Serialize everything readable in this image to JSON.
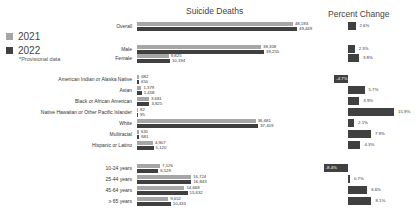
{
  "legend": {
    "items": [
      {
        "label": "2021",
        "color": "#a6a6a6"
      },
      {
        "label": "2022",
        "color": "#404040"
      }
    ],
    "note": "*Provisional data"
  },
  "titles": {
    "deaths": "Suicide Deaths",
    "percent": "Percent Change"
  },
  "chart_data": [
    {
      "type": "bar",
      "orientation": "horizontal",
      "title": "Suicide Deaths",
      "categories": [
        "Overall",
        "Male",
        "Female",
        "American Indian or Alaska Native",
        "Asian",
        "Black or African American",
        "Native Hawaiian or Other Pacific Islander",
        "White",
        "Multiracial",
        "Hispanic or Latino",
        "10-24 years",
        "25-44 years",
        "45-64 years",
        "≥ 65 years"
      ],
      "series": [
        {
          "name": "2021",
          "color": "#a6a6a6",
          "values": [
            48183,
            38358,
            9825,
            682,
            1379,
            3681,
            82,
            36681,
            631,
            4907,
            7126,
            16724,
            14668,
            9652
          ]
        },
        {
          "name": "2022",
          "color": "#404040",
          "values": [
            49449,
            39255,
            10194,
            650,
            1458,
            3825,
            95,
            37459,
            681,
            5120,
            6529,
            16843,
            15632,
            10433
          ]
        }
      ],
      "xlabel": "",
      "ylabel": "",
      "grid": false,
      "legend_position": "left"
    },
    {
      "type": "bar",
      "orientation": "horizontal",
      "title": "Percent Change",
      "categories": [
        "Overall",
        "Male",
        "Female",
        "American Indian or Alaska Native",
        "Asian",
        "Black or African American",
        "Native Hawaiian or Other Pacific Islander",
        "White",
        "Multiracial",
        "Hispanic or Latino",
        "10-24 years",
        "25-44 years",
        "45-64 years",
        "≥ 65 years"
      ],
      "values": [
        2.6,
        2.3,
        3.8,
        -4.7,
        5.7,
        3.9,
        15.9,
        2.1,
        7.9,
        4.3,
        -8.4,
        0.7,
        6.6,
        8.1
      ],
      "labels": [
        "2.6%",
        "2.3%",
        "3.8%",
        "-4.7%",
        "5.7%",
        "3.9%",
        "15.9%",
        "2.1%",
        "7.9%",
        "4.3%",
        "-8.4%",
        "0.7%",
        "6.6%",
        "8.1%"
      ],
      "color": "#404040",
      "grid": false
    }
  ],
  "rows": [
    {
      "label": "Overall",
      "v2021": "48,183",
      "v2022": "49,449",
      "pct": "2.6%"
    },
    {
      "label": "Male",
      "v2021": "38,358",
      "v2022": "39,255",
      "pct": "2.3%"
    },
    {
      "label": "Female",
      "v2021": "9,825",
      "v2022": "10,194",
      "pct": "3.8%"
    },
    {
      "label": "American Indian or Alaska Native",
      "v2021": "682",
      "v2022": "650",
      "pct": "-4.7%"
    },
    {
      "label": "Asian",
      "v2021": "1,379",
      "v2022": "1,458",
      "pct": "5.7%"
    },
    {
      "label": "Black or African American",
      "v2021": "3,681",
      "v2022": "3,825",
      "pct": "3.9%"
    },
    {
      "label": "Native Hawaiian or Other Pacific Islander",
      "v2021": "82",
      "v2022": "95",
      "pct": "15.9%"
    },
    {
      "label": "White",
      "v2021": "36,681",
      "v2022": "37,459",
      "pct": "2.1%"
    },
    {
      "label": "Multiracial",
      "v2021": "631",
      "v2022": "681",
      "pct": "7.9%"
    },
    {
      "label": "Hispanic or Latino",
      "v2021": "4,907",
      "v2022": "5,120",
      "pct": "4.3%"
    },
    {
      "label": "10-24 years",
      "v2021": "7,126",
      "v2022": "6,529",
      "pct": "-8.4%"
    },
    {
      "label": "25-44 years",
      "v2021": "16,724",
      "v2022": "16,843",
      "pct": "0.7%"
    },
    {
      "label": "45-64 years",
      "v2021": "14,668",
      "v2022": "15,632",
      "pct": "6.6%"
    },
    {
      "label": "≥ 65 years",
      "v2021": "9,652",
      "v2022": "10,433",
      "pct": "8.1%"
    }
  ]
}
